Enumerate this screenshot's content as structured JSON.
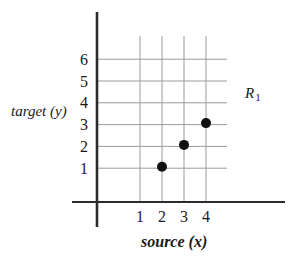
{
  "colors": {
    "background": "#ffffff",
    "axis": "#2b2b2b",
    "grid": "#9b9b9b",
    "point": "#101010",
    "text": "#1a1a1a"
  },
  "chart_data": {
    "type": "scatter",
    "title": "",
    "xlabel": "source (x)",
    "ylabel": "target (y)",
    "x_ticks": [
      1,
      2,
      3,
      4
    ],
    "y_ticks": [
      1,
      2,
      3,
      4,
      5,
      6
    ],
    "points": [
      [
        2,
        1
      ],
      [
        3,
        2
      ],
      [
        4,
        3
      ]
    ],
    "xlim": [
      0,
      5
    ],
    "ylim": [
      0,
      7
    ],
    "grid": true,
    "legend": false,
    "annotation": {
      "main": "R",
      "sub": "1",
      "position": "upper-right"
    }
  }
}
